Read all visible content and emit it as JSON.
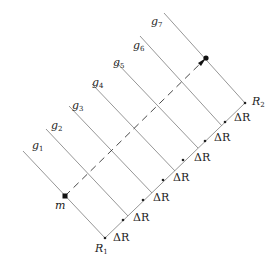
{
  "diagram": {
    "lines": [
      {
        "label": "g",
        "sub": "1"
      },
      {
        "label": "g",
        "sub": "2"
      },
      {
        "label": "g",
        "sub": "3"
      },
      {
        "label": "g",
        "sub": "4"
      },
      {
        "label": "g",
        "sub": "5"
      },
      {
        "label": "g",
        "sub": "6"
      },
      {
        "label": "g",
        "sub": "7"
      }
    ],
    "start_point": {
      "label": "m"
    },
    "baseline": {
      "start": {
        "label": "R",
        "sub": "1"
      },
      "end": {
        "label": "R",
        "sub": "2"
      },
      "interval_label": "ΔR",
      "interval_count": 7
    },
    "colors": {
      "line": "#8a8a8a",
      "text": "#222222",
      "dot": "#111111"
    }
  }
}
